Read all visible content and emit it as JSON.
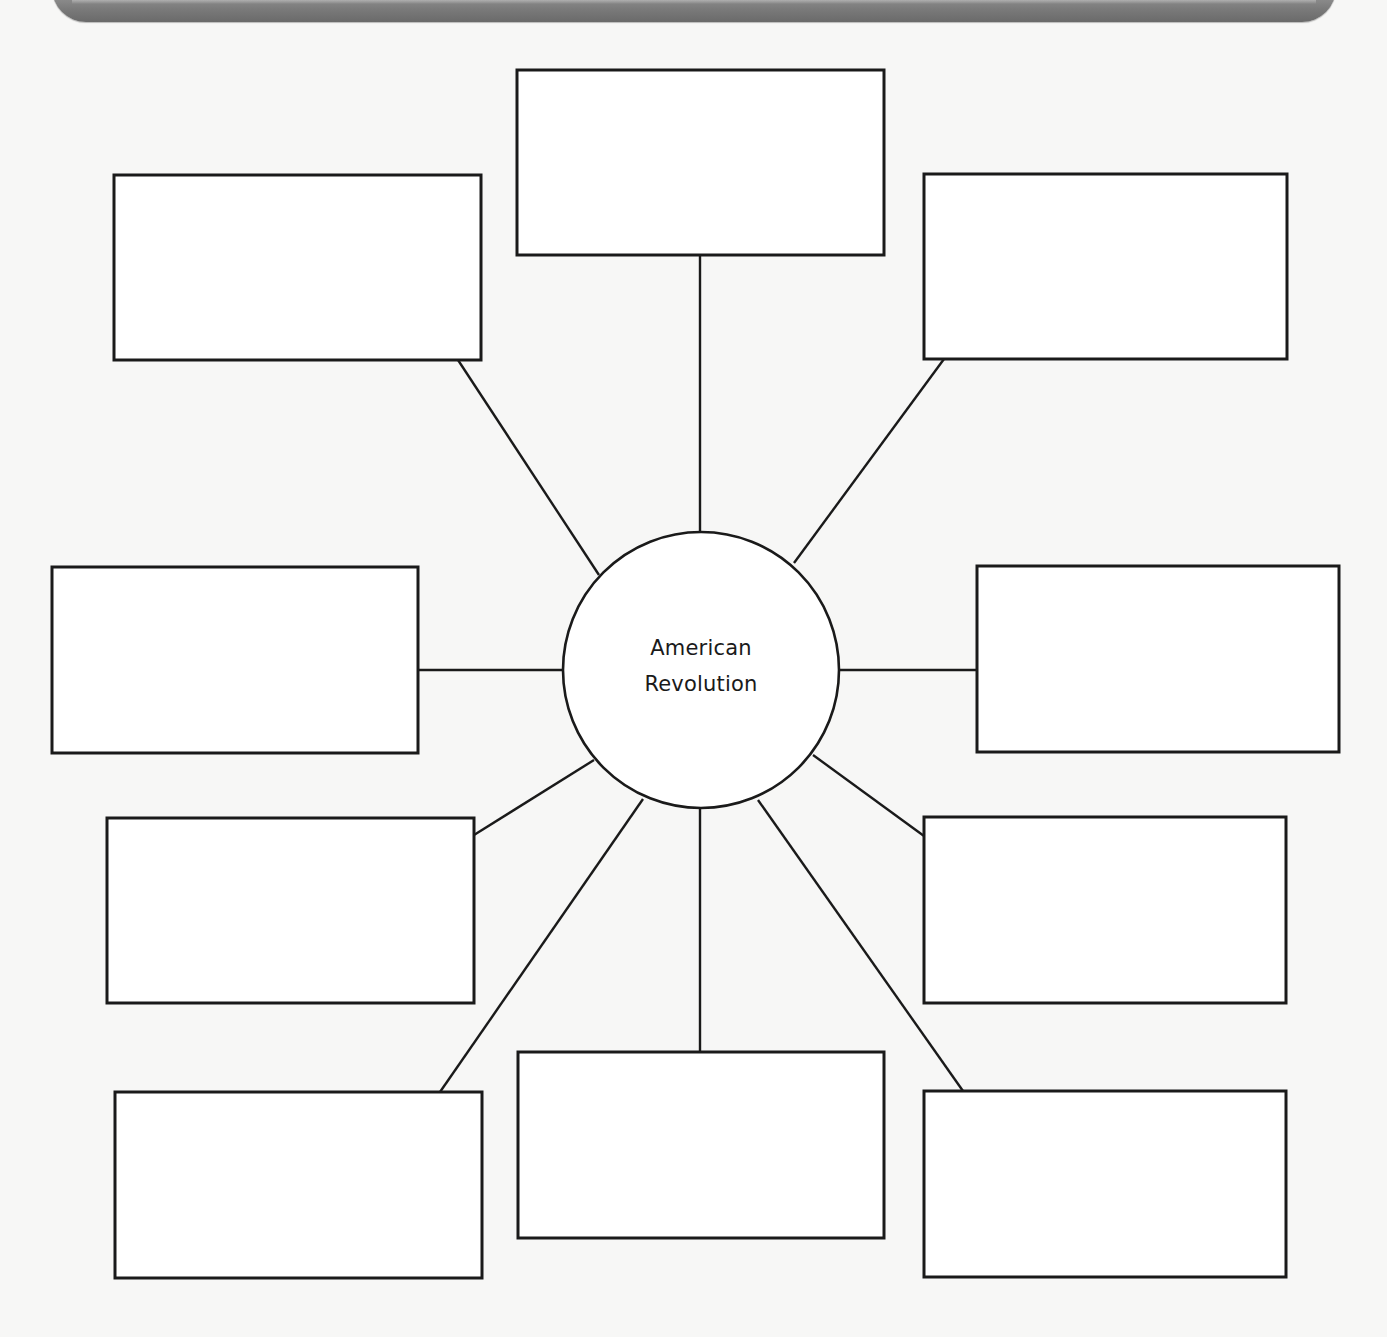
{
  "diagram": {
    "type": "concept-web",
    "center_topic": {
      "line1": "American",
      "line2": "Revolution"
    },
    "branches": [
      {
        "id": "top",
        "text": ""
      },
      {
        "id": "top-left",
        "text": ""
      },
      {
        "id": "top-right",
        "text": ""
      },
      {
        "id": "left",
        "text": ""
      },
      {
        "id": "right",
        "text": ""
      },
      {
        "id": "middle-left",
        "text": ""
      },
      {
        "id": "middle-right",
        "text": ""
      },
      {
        "id": "bottom-left",
        "text": ""
      },
      {
        "id": "bottom-center",
        "text": ""
      },
      {
        "id": "bottom-right",
        "text": ""
      }
    ],
    "colors": {
      "line": "#1a1a1a",
      "banner": "#7a7a7a",
      "page": "#f7f7f6"
    }
  }
}
